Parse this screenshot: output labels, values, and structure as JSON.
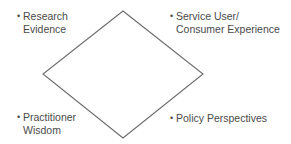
{
  "diagram": {
    "shape": "diamond",
    "stroke_color": "#6b6b6b",
    "text_color": "#4a4a4a",
    "vertices": {
      "top": [
        123,
        11
      ],
      "right": [
        203,
        74
      ],
      "bottom": [
        123,
        138
      ],
      "left": [
        43,
        74
      ]
    },
    "labels": [
      {
        "position": "top-left",
        "bullet": "•",
        "lines": [
          "Research",
          "Evidence"
        ]
      },
      {
        "position": "top-right",
        "bullet": "•",
        "lines": [
          "Service User/",
          "Consumer Experience"
        ]
      },
      {
        "position": "bottom-left",
        "bullet": "•",
        "lines": [
          "Practitioner",
          "Wisdom"
        ]
      },
      {
        "position": "bottom-right",
        "bullet": "•",
        "lines": [
          "Policy Perspectives"
        ]
      }
    ]
  }
}
